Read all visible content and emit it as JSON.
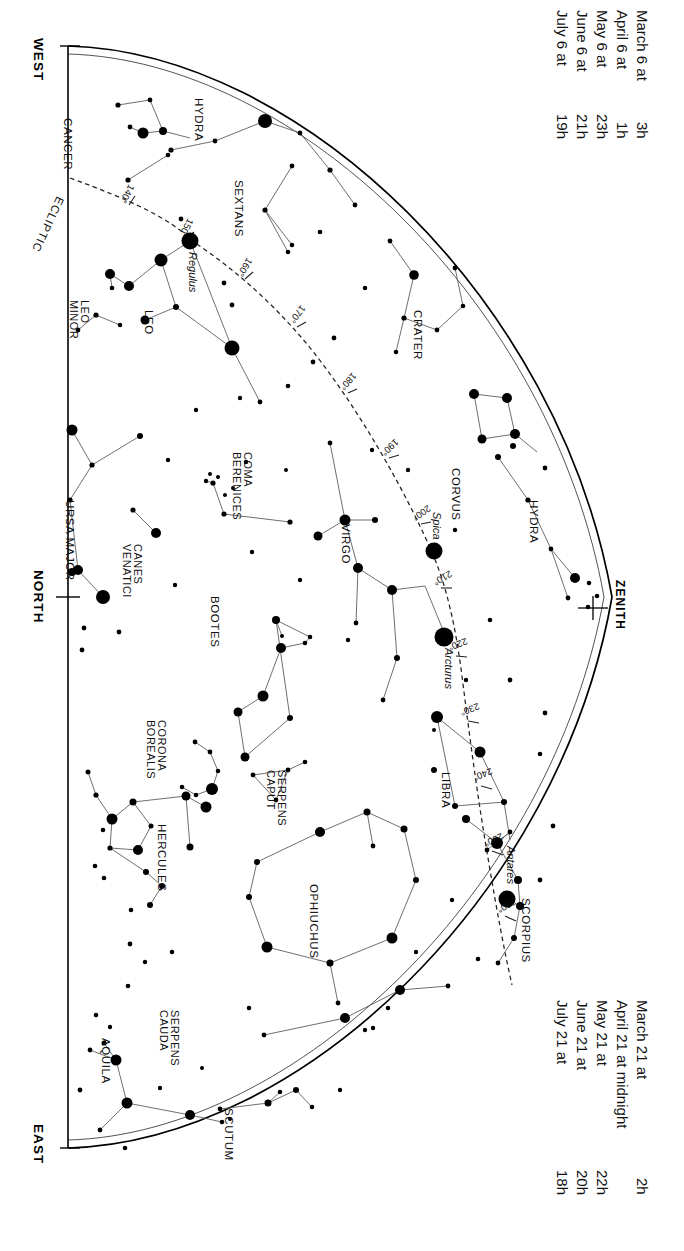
{
  "chart": {
    "kind": "star-chart",
    "title_hidden": "",
    "cardinals": [
      {
        "name": "west",
        "label": "WEST"
      },
      {
        "name": "north",
        "label": "NORTH"
      },
      {
        "name": "east",
        "label": "EAST"
      },
      {
        "name": "zenith",
        "label": "ZENITH"
      }
    ],
    "ecliptic_label": "ECLIPTIC",
    "ecliptic_ticks": [
      "140°",
      "150°",
      "160°",
      "170°",
      "180°",
      "190°",
      "200°",
      "210°",
      "220°",
      "230°",
      "240°",
      "250°",
      "260°"
    ],
    "named_stars": [
      {
        "name": "regulus",
        "label": "Regulus"
      },
      {
        "name": "spica",
        "label": "Spica"
      },
      {
        "name": "arcturus",
        "label": "Arcturus"
      },
      {
        "name": "antares",
        "label": "Antares"
      }
    ],
    "constellations": [
      {
        "name": "cancer",
        "label": "CANCER"
      },
      {
        "name": "hydra-upper",
        "label": "HYDRA"
      },
      {
        "name": "sextans",
        "label": "SEXTANS"
      },
      {
        "name": "leo",
        "label": "LEO"
      },
      {
        "name": "leo-minor",
        "label": "LEO\nMINOR"
      },
      {
        "name": "crater",
        "label": "CRATER"
      },
      {
        "name": "corvus",
        "label": "CORVUS"
      },
      {
        "name": "hydra-lower",
        "label": "HYDRA"
      },
      {
        "name": "ursa-major",
        "label": "URSA MAJOR"
      },
      {
        "name": "canes-venatici",
        "label": "CANES\nVENATICI"
      },
      {
        "name": "coma-berenices",
        "label": "COMA\nBERENICES"
      },
      {
        "name": "virgo",
        "label": "VIRGO"
      },
      {
        "name": "bootes",
        "label": "BOOTES"
      },
      {
        "name": "corona-borealis",
        "label": "CORONA\nBOREALIS"
      },
      {
        "name": "serpens-caput",
        "label": "SERPENS\nCAPUT"
      },
      {
        "name": "libra",
        "label": "LIBRA"
      },
      {
        "name": "hercules",
        "label": "HERCULES"
      },
      {
        "name": "ophiuchus",
        "label": "OPHIUCHUS"
      },
      {
        "name": "scorpius",
        "label": "SCORPIUS"
      },
      {
        "name": "serpens-cauda",
        "label": "SERPENS\nCAUDA"
      },
      {
        "name": "aquila",
        "label": "AQUILA"
      },
      {
        "name": "scutum",
        "label": "SCUTUM"
      }
    ],
    "time_legend_top": {
      "name": "time-legend-top",
      "rows": [
        {
          "date": "March 6 at",
          "time": "3",
          "unit": "h"
        },
        {
          "date": "April 6 at",
          "time": "1",
          "unit": "h"
        },
        {
          "date": "May 6 at",
          "time": "23",
          "unit": "h"
        },
        {
          "date": "June 6 at",
          "time": "21",
          "unit": "h"
        },
        {
          "date": "July 6 at",
          "time": "19",
          "unit": "h"
        }
      ]
    },
    "time_legend_bottom": {
      "name": "time-legend-bottom",
      "rows": [
        {
          "date": "March 21 at",
          "time": "2",
          "unit": "h"
        },
        {
          "date": "April 21 at midnight",
          "time": "",
          "unit": ""
        },
        {
          "date": "May 21 at",
          "time": "22",
          "unit": "h"
        },
        {
          "date": "June 21 at",
          "time": "20",
          "unit": "h"
        },
        {
          "date": "July 21 at",
          "time": "18",
          "unit": "h"
        }
      ]
    },
    "colors": {
      "ink": "#111111",
      "star": "#000000",
      "line": "#4a4a4a",
      "horizon": "#000000",
      "ecliptic": "#333333",
      "background": "#ffffff"
    }
  }
}
